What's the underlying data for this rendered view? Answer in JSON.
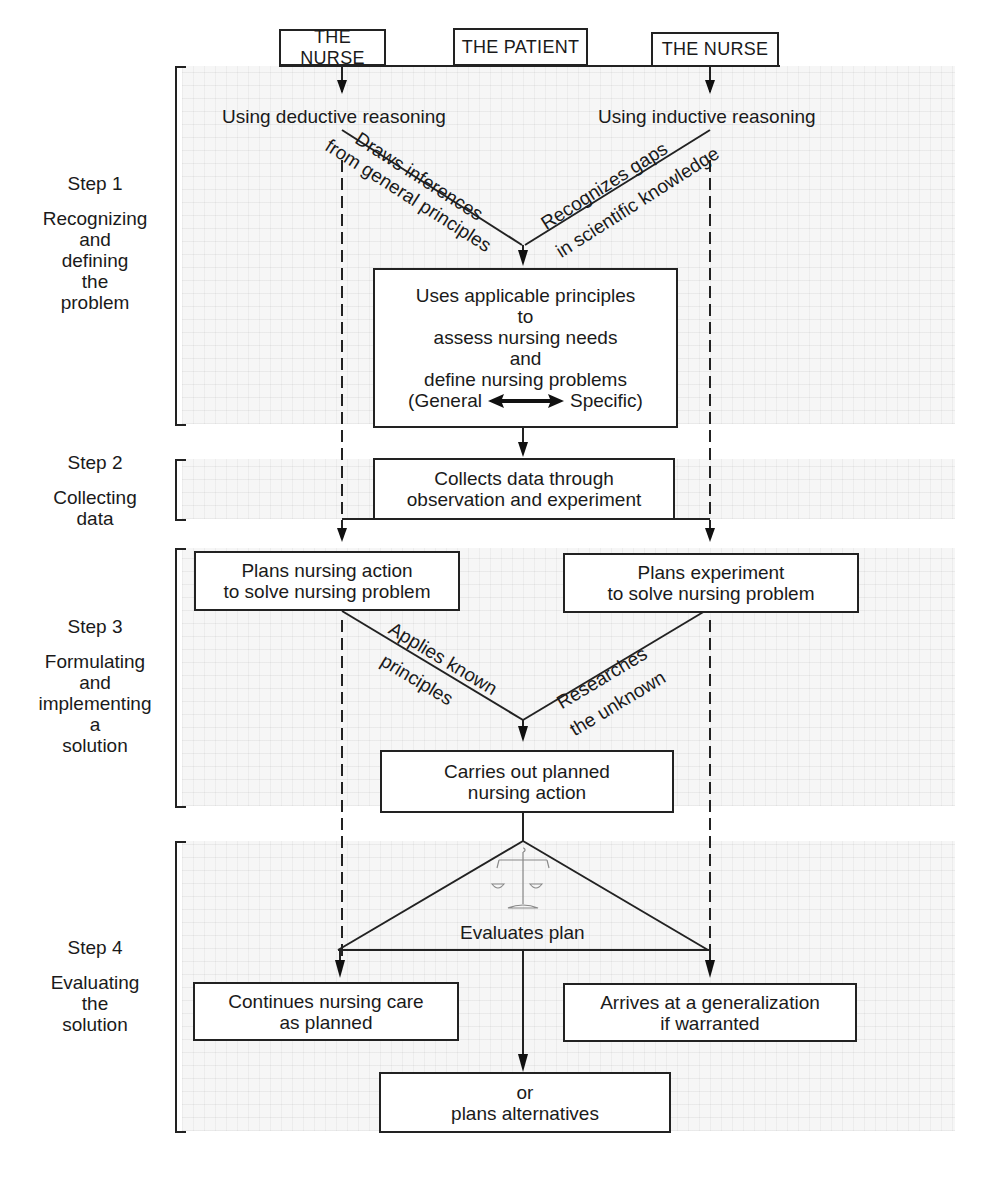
{
  "header_boxes": [
    "THE NURSE",
    "THE PATIENT",
    "THE NURSE"
  ],
  "steps": [
    {
      "number": "Step 1",
      "lines": [
        "Recognizing",
        "and",
        "defining",
        "the",
        "problem"
      ]
    },
    {
      "number": "Step 2",
      "lines": [
        "Collecting",
        "data"
      ]
    },
    {
      "number": "Step 3",
      "lines": [
        "Formulating",
        "and",
        "implementing",
        "a",
        "solution"
      ]
    },
    {
      "number": "Step 4",
      "lines": [
        "Evaluating",
        "the",
        "solution"
      ]
    }
  ],
  "reasoning": {
    "deductive": "Using deductive reasoning",
    "inductive": "Using inductive reasoning",
    "deductive_line1": "Draws inferences",
    "deductive_line2": "from general principles",
    "inductive_line1": "Recognizes gaps",
    "inductive_line2": "in scientific knowledge"
  },
  "boxes": {
    "assess": [
      "Uses applicable principles",
      "to",
      "assess nursing needs",
      "and",
      "define nursing problems"
    ],
    "assess_general": "(General",
    "assess_specific": "Specific)",
    "collect": [
      "Collects data through",
      "observation and experiment"
    ],
    "plan_action": [
      "Plans nursing action",
      "to solve nursing problem"
    ],
    "plan_experiment": [
      "Plans experiment",
      "to solve nursing problem"
    ],
    "carry_out": [
      "Carries out planned",
      "nursing action"
    ],
    "continue": [
      "Continues nursing care",
      "as planned"
    ],
    "generalize": [
      "Arrives at a generalization",
      "if warranted"
    ],
    "alternatives": [
      "or",
      "plans alternatives"
    ]
  },
  "step3_labels": {
    "applies_line1": "Applies known",
    "applies_line2": "principles",
    "researches_line1": "Researches",
    "researches_line2": "the unknown"
  },
  "evaluate_label": "Evaluates plan",
  "icons": {
    "scale": "balance-scale-icon",
    "bidirectional": "double-arrow-icon"
  }
}
